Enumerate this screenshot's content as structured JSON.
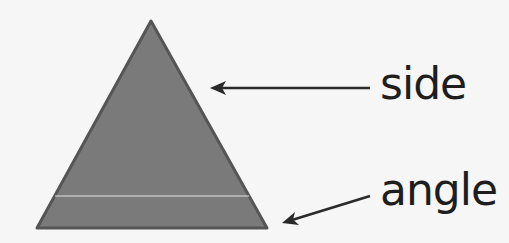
{
  "diagram": {
    "shape": "triangle",
    "colors": {
      "background": "#f6f6f6",
      "triangle_fill": "#7a7a7a",
      "triangle_stroke": "#555555",
      "arrow": "#2a2a2a",
      "text": "#1e1e1e",
      "highlight_line": "#e8e8e8"
    },
    "labels": {
      "side": "side",
      "angle": "angle"
    }
  }
}
